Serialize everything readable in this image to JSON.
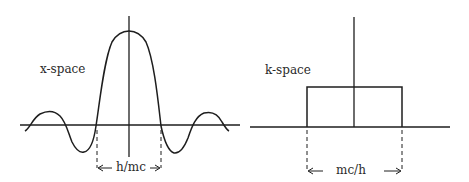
{
  "left_panel": {
    "label": "x-space",
    "width_label": "h/mc",
    "curve": "sinc"
  },
  "right_panel": {
    "label": "k-space",
    "width_label": "mc/h",
    "curve": "rect"
  },
  "colors": {
    "ink": "#1e1e1e",
    "background": "#ffffff"
  }
}
